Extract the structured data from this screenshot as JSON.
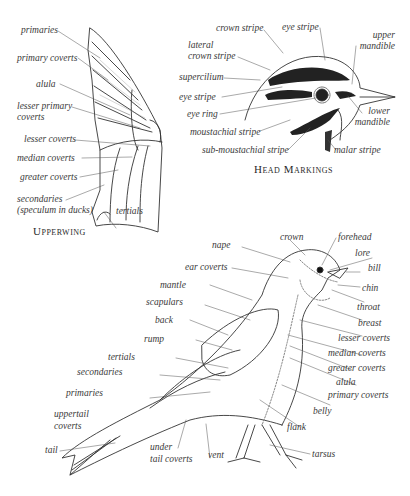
{
  "upperwing": {
    "caption": "Upperwing",
    "labels": {
      "primaries": "primaries",
      "primary_coverts": "primary coverts",
      "alula": "alula",
      "lesser_primary_coverts_1": "lesser primary",
      "lesser_primary_coverts_2": "coverts",
      "lesser_coverts": "lesser coverts",
      "median_coverts": "median coverts",
      "greater_coverts": "greater coverts",
      "secondaries_1": "secondaries",
      "secondaries_2": "(speculum in ducks)",
      "tertials": "tertials"
    }
  },
  "head": {
    "caption": "Head Markings",
    "labels": {
      "crown_stripe": "crown stripe",
      "eye_stripe_top": "eye stripe",
      "upper_mandible_1": "upper",
      "upper_mandible_2": "mandible",
      "lateral_crown_stripe_1": "lateral",
      "lateral_crown_stripe_2": "crown stripe",
      "supercilium": "supercilium",
      "eye_stripe": "eye stripe",
      "eye_ring": "eye ring",
      "moustachial_stripe": "moustachial stripe",
      "sub_moustachial_stripe": "sub-moustachial stripe",
      "lower_mandible_1": "lower",
      "lower_mandible_2": "mandible",
      "malar_stripe": "malar stripe"
    }
  },
  "body": {
    "labels": {
      "crown": "crown",
      "forehead": "forehead",
      "nape": "nape",
      "lore": "lore",
      "ear_coverts": "ear coverts",
      "bill": "bill",
      "chin": "chin",
      "mantle": "mantle",
      "throat": "throat",
      "scapulars": "scapulars",
      "breast": "breast",
      "back": "back",
      "lesser_coverts": "lesser coverts",
      "rump": "rump",
      "median_coverts": "median coverts",
      "tertials": "tertials",
      "greater_coverts": "greater coverts",
      "secondaries": "secondaries",
      "alula": "alula",
      "primaries": "primaries",
      "primary_coverts": "primary coverts",
      "uppertail_coverts_1": "uppertail",
      "uppertail_coverts_2": "coverts",
      "belly": "belly",
      "flank": "flank",
      "tail": "tail",
      "undertail_coverts_1": "under",
      "undertail_coverts_2": "tail coverts",
      "vent": "vent",
      "tarsus": "tarsus"
    }
  },
  "colors": {
    "line": "#333333",
    "leader": "#555555",
    "text": "#3a3a3a",
    "background": "#ffffff"
  }
}
